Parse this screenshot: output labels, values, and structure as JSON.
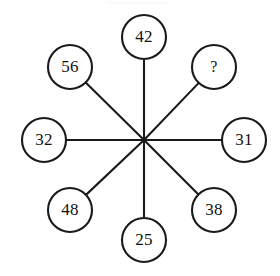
{
  "figure": {
    "title": "",
    "type": "radial-spoke-number-puzzle",
    "canvas": {
      "width": 280,
      "height": 276,
      "background": "#ffffff"
    },
    "stroke_color": "#1a1a1a",
    "text_color": "#111111",
    "hub": {
      "cx": 144,
      "cy": 140,
      "label": ""
    },
    "node_radius": 22,
    "nodes": [
      {
        "id": "node-top",
        "label": "42",
        "cx": 144,
        "cy": 37,
        "position": "top"
      },
      {
        "id": "node-top-right",
        "label": "?",
        "cx": 214,
        "cy": 67,
        "position": "top-right"
      },
      {
        "id": "node-right",
        "label": "31",
        "cx": 244,
        "cy": 140,
        "position": "right"
      },
      {
        "id": "node-bottom-right",
        "label": "38",
        "cx": 214,
        "cy": 210,
        "position": "bottom-right"
      },
      {
        "id": "node-bottom",
        "label": "25",
        "cx": 144,
        "cy": 240,
        "position": "bottom"
      },
      {
        "id": "node-bottom-left",
        "label": "48",
        "cx": 70,
        "cy": 210,
        "position": "bottom-left"
      },
      {
        "id": "node-left",
        "label": "32",
        "cx": 44,
        "cy": 140,
        "position": "left"
      },
      {
        "id": "node-top-left",
        "label": "56",
        "cx": 70,
        "cy": 67,
        "position": "top-left"
      }
    ]
  },
  "chart_data": {
    "type": "diagram",
    "title": "",
    "categories": [
      "top",
      "top-right",
      "right",
      "bottom-right",
      "bottom",
      "bottom-left",
      "left",
      "top-left"
    ],
    "values": [
      "42",
      "?",
      "31",
      "38",
      "25",
      "48",
      "32",
      "56"
    ],
    "legend": [],
    "grid": false
  }
}
